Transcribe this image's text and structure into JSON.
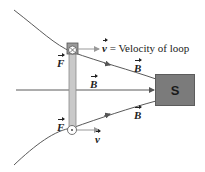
{
  "diagram": {
    "magnet_label": "S",
    "velocity_label": "= Velocity of loop",
    "vector_v": "v",
    "vector_B": "B",
    "vector_F": "F",
    "colors": {
      "field_line": "#5a5a5a",
      "loop": "#b0b0b0",
      "magnet": "#7b7b7b"
    }
  }
}
